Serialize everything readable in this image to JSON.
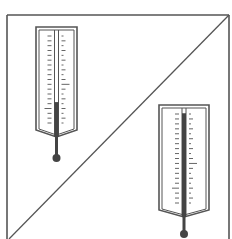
{
  "figure": {
    "description": "Square frame split by a diagonal; two thermometers with different mercury levels",
    "width": 232,
    "height": 239
  },
  "colors": {
    "background": "#ffffff",
    "stroke": "#555555",
    "mercury": "#444444",
    "tick": "#666666"
  },
  "frame": {
    "left": 7,
    "top": 15,
    "right": 229,
    "bottom": 239,
    "diagonal": {
      "x1": 229,
      "y1": 15,
      "x2": 9,
      "y2": 239
    }
  },
  "thermometers": [
    {
      "label": "thermometer-upper-left",
      "x": 36,
      "y": 27,
      "width": 41,
      "body_height": 103,
      "chevron": 7,
      "stem_length": 21,
      "bulb_radius": 4,
      "ticks": 19,
      "mercury_level_pct": 30
    },
    {
      "label": "thermometer-lower-right",
      "x": 159,
      "y": 105,
      "width": 50,
      "body_height": 105,
      "chevron": 7,
      "stem_length": 17,
      "bulb_radius": 4,
      "ticks": 19,
      "mercury_level_pct": 95
    }
  ]
}
